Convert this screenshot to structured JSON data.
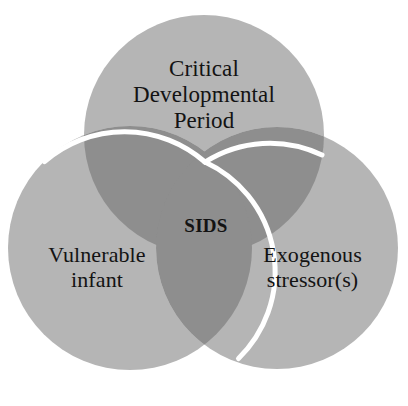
{
  "diagram": {
    "type": "venn",
    "background_color": "#ffffff",
    "circle_fill_color": "#b5b5b5",
    "overlap_fill_color": "#8e8e8e",
    "stroke_color": "#ffffff",
    "text_color": "#131313",
    "sets": [
      {
        "id": "critical-developmental-period",
        "label": "Critical\nDevelopmental\nPeriod",
        "position": "top",
        "cx": 204,
        "cy": 135,
        "r": 120
      },
      {
        "id": "vulnerable-infant",
        "label": "Vulnerable\ninfant",
        "position": "bottom-left",
        "cx": 130,
        "cy": 248,
        "r": 122
      },
      {
        "id": "exogenous-stressors",
        "label": "Exogenous\nstressor(s)",
        "position": "bottom-right",
        "cx": 277,
        "cy": 248,
        "r": 121
      }
    ],
    "intersection": {
      "id": "sids",
      "label": "SIDS",
      "emphasis": "bold",
      "cx": 205,
      "cy": 225
    }
  }
}
